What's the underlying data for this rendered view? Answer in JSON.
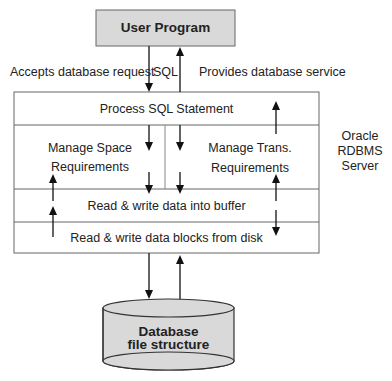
{
  "diagram": {
    "user_program": {
      "label": "User Program",
      "fill": "#d9d9d9"
    },
    "edge_labels": {
      "accepts": "Accepts database request",
      "sql": "SQL",
      "provides": "Provides database service"
    },
    "server": {
      "name_lines": [
        "Oracle",
        "RDBMS",
        "Server"
      ],
      "layers": {
        "process_sql": "Process SQL Statement",
        "manage_space": [
          "Manage Space",
          "Requirements"
        ],
        "manage_trans": [
          "Manage Trans.",
          "Requirements"
        ],
        "buffer": "Read & write data into buffer",
        "disk": "Read & write data blocks from disk"
      }
    },
    "database": {
      "lines": [
        "Database",
        "file structure"
      ],
      "fill": "#d9d9d9"
    }
  }
}
